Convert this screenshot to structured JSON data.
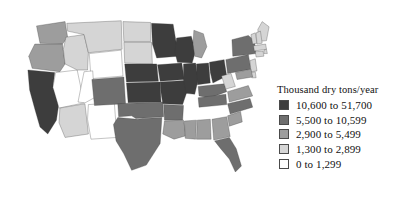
{
  "figure": {
    "type": "choropleth-map",
    "region": "contiguous-united-states"
  },
  "legend": {
    "title": "Thousand dry tons/year",
    "items": [
      {
        "label": "10,600 to 51,700",
        "color": "#3d3d3d",
        "tier": 5
      },
      {
        "label": "5,500 to 10,599",
        "color": "#6e6e6e",
        "tier": 4
      },
      {
        "label": "2,900 to 5,499",
        "color": "#9d9d9d",
        "tier": 3
      },
      {
        "label": "1,300 to 2,899",
        "color": "#d5d5d5",
        "tier": 2
      },
      {
        "label": "0 to 1,299",
        "color": "#ffffff",
        "tier": 1
      }
    ]
  },
  "chart_data": {
    "type": "heatmap",
    "title": "Thousand dry tons/year",
    "xlabel": "",
    "ylabel": "",
    "colorscale": [
      "#ffffff",
      "#d5d5d5",
      "#9d9d9d",
      "#6e6e6e",
      "#3d3d3d"
    ],
    "bins": [
      {
        "tier": 1,
        "range": [
          0,
          1299
        ],
        "label": "0 to 1,299"
      },
      {
        "tier": 2,
        "range": [
          1300,
          2899
        ],
        "label": "1,300 to 2,899"
      },
      {
        "tier": 3,
        "range": [
          2900,
          5499
        ],
        "label": "2,900 to 5,499"
      },
      {
        "tier": 4,
        "range": [
          5500,
          10599
        ],
        "label": "5,500 to 10,599"
      },
      {
        "tier": 5,
        "range": [
          10600,
          51700
        ],
        "label": "10,600 to 51,700"
      }
    ],
    "categories": [
      "WA",
      "OR",
      "CA",
      "NV",
      "ID",
      "MT",
      "WY",
      "UT",
      "AZ",
      "NM",
      "CO",
      "ND",
      "SD",
      "NE",
      "KS",
      "OK",
      "TX",
      "MN",
      "IA",
      "MO",
      "AR",
      "LA",
      "WI",
      "IL",
      "MS",
      "AL",
      "MI",
      "IN",
      "OH",
      "KY",
      "TN",
      "GA",
      "FL",
      "SC",
      "NC",
      "VA",
      "WV",
      "PA",
      "NY",
      "ME",
      "VT",
      "NH",
      "MA",
      "RI",
      "CT",
      "NJ",
      "DE",
      "MD"
    ],
    "values": [
      3,
      3,
      5,
      1,
      2,
      2,
      1,
      1,
      2,
      1,
      4,
      2,
      2,
      5,
      5,
      4,
      4,
      5,
      5,
      5,
      4,
      3,
      5,
      5,
      3,
      3,
      3,
      5,
      5,
      4,
      4,
      3,
      4,
      3,
      4,
      3,
      2,
      4,
      4,
      2,
      2,
      2,
      2,
      2,
      2,
      2,
      2,
      3
    ]
  },
  "states": {
    "WA": "Washington",
    "OR": "Oregon",
    "CA": "California",
    "NV": "Nevada",
    "ID": "Idaho",
    "MT": "Montana",
    "WY": "Wyoming",
    "UT": "Utah",
    "AZ": "Arizona",
    "NM": "New Mexico",
    "CO": "Colorado",
    "ND": "North Dakota",
    "SD": "South Dakota",
    "NE": "Nebraska",
    "KS": "Kansas",
    "OK": "Oklahoma",
    "TX": "Texas",
    "MN": "Minnesota",
    "IA": "Iowa",
    "MO": "Missouri",
    "AR": "Arkansas",
    "LA": "Louisiana",
    "WI": "Wisconsin",
    "IL": "Illinois",
    "MS": "Mississippi",
    "AL": "Alabama",
    "MI": "Michigan",
    "IN": "Indiana",
    "OH": "Ohio",
    "KY": "Kentucky",
    "TN": "Tennessee",
    "GA": "Georgia",
    "FL": "Florida",
    "SC": "South Carolina",
    "NC": "North Carolina",
    "VA": "Virginia",
    "WV": "West Virginia",
    "PA": "Pennsylvania",
    "NY": "New York",
    "ME": "Maine",
    "VT": "Vermont",
    "NH": "New Hampshire",
    "MA": "Massachusetts",
    "RI": "Rhode Island",
    "CT": "Connecticut",
    "NJ": "New Jersey",
    "DE": "Delaware",
    "MD": "Maryland"
  }
}
